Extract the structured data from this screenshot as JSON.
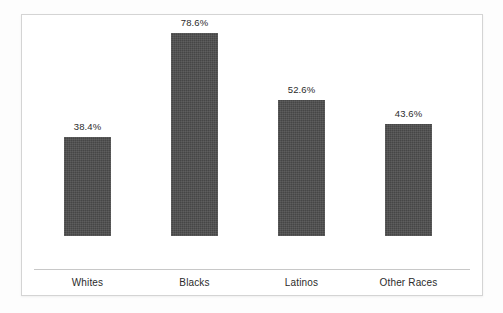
{
  "chart_data": {
    "type": "bar",
    "title": "",
    "subtitle": "",
    "xlabel": "",
    "ylabel": "",
    "categories": [
      "Whites",
      "Blacks",
      "Latinos",
      "Other Races"
    ],
    "values": [
      38.4,
      78.6,
      52.6,
      43.6
    ],
    "value_labels": [
      "38.4%",
      "78.6%",
      "52.6%",
      "43.6%"
    ],
    "ylim": [
      0,
      100
    ],
    "grid": false,
    "legend": null,
    "y_axis_visible": false,
    "y_tick_labels": [],
    "bar_color": "#4c4c4c",
    "axis_line_color": "#c8c8c8",
    "text_color": "#2b2b2b",
    "frame_color": "#d4d4d4",
    "background_color": "#ffffff"
  }
}
